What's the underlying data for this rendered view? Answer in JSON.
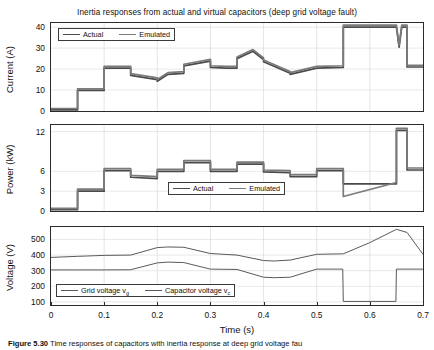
{
  "figure": {
    "title": "Inertia responses from actual and virtual capacitors (deep grid voltage fault)",
    "caption_label": "Figure 5.30",
    "caption_text": "Time responses of capacitors with inertia response at deep grid voltage fau"
  },
  "colors": {
    "actual": "#4a4a4a",
    "emulated": "#7a7a7a",
    "grid_voltage": "#5a5a5a",
    "capacitor_voltage": "#5a5a5a",
    "axis": "#2b2b2b",
    "gridline": "#d9d9d9"
  },
  "panels": {
    "current": {
      "ylabel": "Current (A)",
      "yticks": [
        "0",
        "10",
        "20",
        "30",
        "40"
      ],
      "legend": [
        {
          "label": "Actual",
          "key": "actual"
        },
        {
          "label": "Emulated",
          "key": "emulated"
        }
      ]
    },
    "power": {
      "ylabel": "Power (kW)",
      "yticks": [
        "0",
        "3",
        "6",
        "12"
      ],
      "legend": [
        {
          "label": "Actual",
          "key": "actual"
        },
        {
          "label": "Emulated",
          "key": "emulated"
        }
      ]
    },
    "voltage": {
      "ylabel": "Voltage (V)",
      "yticks": [
        "100",
        "200",
        "300",
        "400",
        "500"
      ],
      "xlabel": "Time (s)",
      "xticks": [
        "0",
        "0.1",
        "0.2",
        "0.3",
        "0.4",
        "0.5",
        "0.6",
        "0.7"
      ],
      "legend": [
        {
          "label": "Grid voltage v",
          "sub": "g",
          "key": "grid_voltage"
        },
        {
          "label": "Capacitor voltage v",
          "sub": "c",
          "key": "capacitor_voltage"
        }
      ]
    }
  },
  "chart_data": [
    {
      "type": "line",
      "id": "current-plot",
      "title": "Inertia responses from actual and virtual capacitors (deep grid voltage fault)",
      "xlabel": "",
      "ylabel": "Current (A)",
      "xlim": [
        0,
        0.7
      ],
      "ylim": [
        0,
        42
      ],
      "yticks": [
        0,
        10,
        20,
        30,
        40
      ],
      "xticks": [
        0,
        0.1,
        0.2,
        0.3,
        0.4,
        0.5,
        0.6,
        0.7
      ],
      "grid": true,
      "legend_position": "top-left",
      "series": [
        {
          "name": "Actual",
          "x": [
            0,
            0.05,
            0.05,
            0.1,
            0.1,
            0.15,
            0.15,
            0.2,
            0.2,
            0.22,
            0.25,
            0.25,
            0.3,
            0.3,
            0.33,
            0.35,
            0.35,
            0.38,
            0.4,
            0.4,
            0.45,
            0.45,
            0.5,
            0.5,
            0.55,
            0.55,
            0.6,
            0.65,
            0.655,
            0.66,
            0.67,
            0.67,
            0.7
          ],
          "y": [
            0.5,
            0.5,
            9.8,
            9.8,
            20.5,
            20.5,
            17.0,
            15.0,
            14.2,
            17.5,
            18.0,
            21.5,
            23.8,
            20.8,
            20.5,
            20.5,
            25.0,
            28.5,
            24.5,
            23.5,
            18.0,
            17.5,
            20.5,
            20.5,
            20.8,
            40.0,
            40.0,
            40.0,
            30.5,
            40.0,
            40.0,
            21.0,
            21.0
          ]
        },
        {
          "name": "Emulated",
          "x": [
            0,
            0.05,
            0.05,
            0.1,
            0.1,
            0.15,
            0.15,
            0.2,
            0.2,
            0.22,
            0.25,
            0.25,
            0.3,
            0.3,
            0.33,
            0.35,
            0.35,
            0.38,
            0.4,
            0.4,
            0.45,
            0.45,
            0.5,
            0.5,
            0.55,
            0.55,
            0.6,
            0.65,
            0.655,
            0.66,
            0.67,
            0.67,
            0.7
          ],
          "y": [
            1.2,
            1.2,
            10.6,
            10.6,
            21.3,
            21.3,
            17.8,
            15.8,
            15.0,
            18.3,
            18.8,
            22.3,
            24.6,
            21.6,
            21.3,
            21.3,
            25.8,
            29.3,
            25.3,
            24.3,
            18.8,
            18.3,
            21.3,
            21.3,
            21.6,
            41.0,
            41.0,
            41.0,
            31.3,
            41.0,
            41.0,
            21.8,
            21.8
          ]
        }
      ]
    },
    {
      "type": "line",
      "id": "power-plot",
      "xlabel": "",
      "ylabel": "Power (kW)",
      "xlim": [
        0,
        0.7
      ],
      "ylim": [
        0,
        13
      ],
      "yticks": [
        0,
        3,
        6,
        12
      ],
      "xticks": [
        0,
        0.1,
        0.2,
        0.3,
        0.4,
        0.5,
        0.6,
        0.7
      ],
      "grid": true,
      "legend_position": "bottom-center",
      "series": [
        {
          "name": "Actual",
          "x": [
            0,
            0.05,
            0.05,
            0.1,
            0.1,
            0.15,
            0.15,
            0.2,
            0.2,
            0.25,
            0.25,
            0.3,
            0.3,
            0.35,
            0.35,
            0.4,
            0.4,
            0.45,
            0.45,
            0.5,
            0.5,
            0.55,
            0.55,
            0.65,
            0.65,
            0.67,
            0.67,
            0.7
          ],
          "y": [
            0.2,
            0.2,
            3.0,
            3.0,
            6.1,
            6.1,
            5.1,
            4.9,
            6.0,
            6.0,
            7.3,
            7.3,
            6.0,
            6.0,
            7.1,
            7.1,
            5.9,
            5.8,
            5.2,
            5.2,
            6.1,
            6.1,
            4.1,
            4.1,
            12.2,
            12.2,
            6.2,
            6.2
          ]
        },
        {
          "name": "Emulated",
          "x": [
            0,
            0.05,
            0.05,
            0.1,
            0.1,
            0.15,
            0.15,
            0.2,
            0.2,
            0.25,
            0.25,
            0.3,
            0.3,
            0.35,
            0.35,
            0.4,
            0.4,
            0.45,
            0.45,
            0.5,
            0.5,
            0.55,
            0.55,
            0.65,
            0.65,
            0.67,
            0.67,
            0.7
          ],
          "y": [
            0.4,
            0.4,
            3.3,
            3.3,
            6.4,
            6.4,
            5.4,
            5.2,
            6.3,
            6.3,
            7.6,
            7.6,
            6.3,
            6.3,
            7.4,
            7.4,
            6.2,
            6.1,
            5.5,
            5.5,
            6.4,
            6.4,
            2.2,
            4.3,
            12.5,
            12.5,
            6.5,
            6.5
          ]
        }
      ]
    },
    {
      "type": "line",
      "id": "voltage-plot",
      "xlabel": "Time (s)",
      "ylabel": "Voltage (V)",
      "xlim": [
        0,
        0.7
      ],
      "ylim": [
        80,
        580
      ],
      "yticks": [
        100,
        200,
        300,
        400,
        500
      ],
      "xticks": [
        0,
        0.1,
        0.2,
        0.3,
        0.4,
        0.5,
        0.6,
        0.7
      ],
      "grid": true,
      "legend_position": "bottom-left",
      "series": [
        {
          "name": "Capacitor voltage v_c",
          "x": [
            0,
            0.05,
            0.1,
            0.15,
            0.2,
            0.22,
            0.25,
            0.3,
            0.35,
            0.4,
            0.42,
            0.45,
            0.5,
            0.55,
            0.6,
            0.65,
            0.67,
            0.7
          ],
          "y": [
            385,
            392,
            398,
            400,
            448,
            452,
            450,
            410,
            400,
            365,
            362,
            368,
            405,
            408,
            480,
            565,
            545,
            405
          ]
        },
        {
          "name": "Grid voltage v_g",
          "x": [
            0,
            0.05,
            0.1,
            0.15,
            0.2,
            0.22,
            0.25,
            0.3,
            0.35,
            0.4,
            0.42,
            0.45,
            0.5,
            0.549,
            0.55,
            0.649,
            0.65,
            0.7
          ],
          "y": [
            305,
            305,
            305,
            306,
            350,
            355,
            352,
            310,
            308,
            258,
            255,
            258,
            310,
            310,
            103,
            103,
            310,
            310
          ]
        }
      ]
    }
  ]
}
